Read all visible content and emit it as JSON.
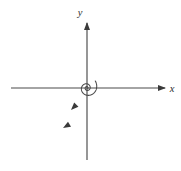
{
  "figure": {
    "kind": "phase-portrait-diagram",
    "title": "",
    "background_color": "#ffffff",
    "stroke_color": "#4a4a4a",
    "arrow_color": "#3a3a3a",
    "label_color": "#2e2e2e",
    "width": 181,
    "height": 171
  },
  "axes": {
    "origin": {
      "x": 87,
      "y": 88
    },
    "x_axis": {
      "label": "x",
      "label_position": {
        "x": 173,
        "y": 92
      },
      "start": {
        "x": 11,
        "y": 88
      },
      "end": {
        "x": 166,
        "y": 88
      },
      "arrow_at": "end"
    },
    "y_axis": {
      "label": "y",
      "label_position": {
        "x": 80,
        "y": 15
      },
      "start": {
        "x": 87,
        "y": 160
      },
      "end": {
        "x": 87,
        "y": 22
      },
      "arrow_at": "end"
    }
  },
  "curve": {
    "name": "logarithmic-spiral",
    "direction": "inward-clockwise",
    "description": "Spiral trajectory winding clockwise inward to the origin",
    "center": {
      "x": 87,
      "y": 88
    },
    "growth_rate_b": 0.176,
    "initial_radius": 1.05,
    "theta_start_deg": -40,
    "theta_end_deg": 760,
    "outer_arc": {
      "name": "outer-spiral-arm",
      "start": {
        "x": 118,
        "y": 27
      },
      "crosses_x_axis_at": {
        "x": 140,
        "y": 88
      },
      "end": {
        "x": 152,
        "y": 116
      }
    },
    "arrowheads": [
      {
        "name": "flow-arrow-upper",
        "x": 71,
        "y": 110,
        "angle_deg": 135
      },
      {
        "name": "flow-arrow-lower",
        "x": 63,
        "y": 128,
        "angle_deg": 150
      }
    ]
  }
}
